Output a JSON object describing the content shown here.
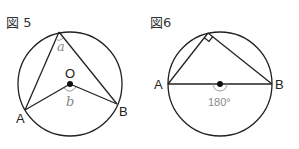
{
  "figure5": {
    "title": "図 5",
    "center_label": "O",
    "point_a_label": "A",
    "point_b_label": "B",
    "inscribed_angle_label": "a",
    "central_angle_label": "b"
  },
  "figure6": {
    "title": "図6",
    "point_a_label": "A",
    "point_b_label": "B",
    "central_angle_label": "180°",
    "right_angle_marker": "right-angle"
  },
  "colors": {
    "line": "#222222",
    "annotation": "#888888"
  }
}
